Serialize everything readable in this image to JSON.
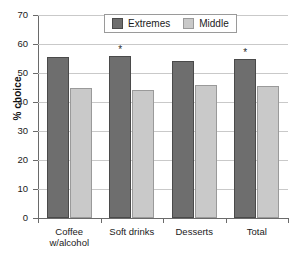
{
  "chart_data": {
    "type": "bar",
    "title": "",
    "xlabel": "",
    "ylabel": "% choice",
    "ylim": [
      0,
      70
    ],
    "yticks": [
      0,
      10,
      20,
      30,
      40,
      50,
      60,
      70
    ],
    "ytick_labels": [
      "0",
      "10",
      "20",
      "30",
      "40",
      "50",
      "60",
      "70"
    ],
    "grid": true,
    "legend_position": "top-center",
    "categories": [
      "Coffee w/alcohol",
      "Soft drinks",
      "Desserts",
      "Total"
    ],
    "category_lines": [
      [
        "Coffee",
        "w/alcohol"
      ],
      [
        "Soft drinks"
      ],
      [
        "Desserts"
      ],
      [
        "Total"
      ]
    ],
    "series": [
      {
        "name": "Extremes",
        "color": "#6e6e6e",
        "values": [
          55.5,
          56.0,
          54.0,
          54.8
        ],
        "significance": [
          "",
          "*",
          "",
          "*"
        ]
      },
      {
        "name": "Middle",
        "color": "#c9c9c9",
        "values": [
          44.8,
          44.2,
          46.0,
          45.4
        ],
        "significance": [
          "",
          "",
          "",
          ""
        ]
      }
    ],
    "annotations": {
      "significance_symbol": "*"
    }
  },
  "axis": {
    "y_title": "% choice"
  },
  "legend": {
    "items": [
      {
        "label": "Extremes",
        "swatch": "extremes-swatch"
      },
      {
        "label": "Middle",
        "swatch": "middle-swatch"
      }
    ]
  }
}
